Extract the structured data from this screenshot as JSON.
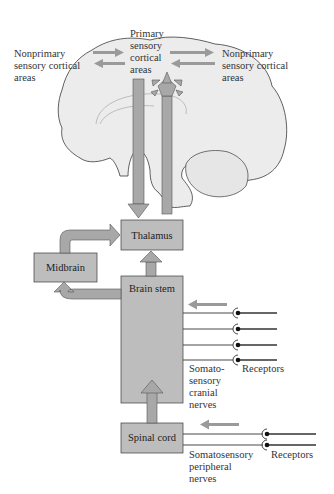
{
  "diagram": {
    "labels": {
      "primary": [
        "Primary",
        "sensory",
        "cortical",
        "areas"
      ],
      "nonprimary_left": [
        "Nonprimary",
        "sensory cortical",
        "areas"
      ],
      "nonprimary_right": [
        "Nonprimary",
        "sensory cortical",
        "areas"
      ],
      "cranial_nerves": [
        "Somato-",
        "sensory",
        "cranial",
        "nerves"
      ],
      "receptors_cranial": "Receptors",
      "peripheral_nerves": [
        "Somatosensory",
        "peripheral",
        "nerves"
      ],
      "receptors_peripheral": "Receptors"
    },
    "boxes": {
      "thalamus": "Thalamus",
      "midbrain": "Midbrain",
      "brain_stem": "Brain stem",
      "spinal_cord": "Spinal cord"
    },
    "colors": {
      "box_fill": "#bdbdbd",
      "arrow_fill": "#a8a8a8",
      "brain_fill": "#ececec",
      "outline": "#3a3a3a",
      "text": "#333333"
    },
    "nerve_lines": {
      "cranial_count": 4,
      "peripheral_count": 2
    }
  }
}
